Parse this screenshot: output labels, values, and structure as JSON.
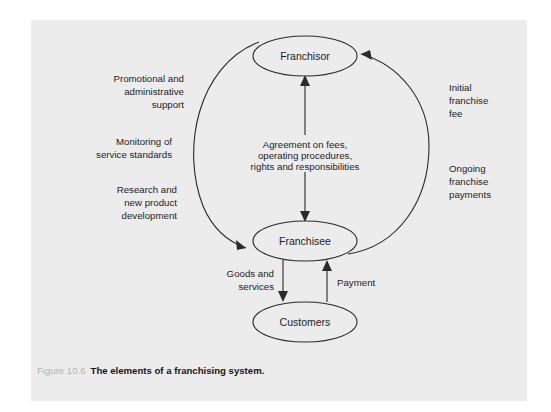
{
  "figure": {
    "caption_number": "Figure 10.6",
    "caption_title": "The elements of a franchising system.",
    "background_color": "#ececec",
    "page_color": "#ffffff",
    "line_color": "#2b2b2b",
    "text_color": "#1c1c1c",
    "caption_number_color": "#b3b3b3"
  },
  "nodes": [
    {
      "id": "franchisor",
      "label": "Franchisor",
      "cx": 274,
      "cy": 36,
      "rx": 52,
      "ry": 20
    },
    {
      "id": "franchisee",
      "label": "Franchisee",
      "cx": 274,
      "cy": 221,
      "rx": 52,
      "ry": 20
    },
    {
      "id": "customers",
      "label": "Customers",
      "cx": 274,
      "cy": 302,
      "rx": 52,
      "ry": 20
    }
  ],
  "center_text": {
    "lines": [
      "Agreement on fees,",
      "operating procedures,",
      "rights and responsibilities"
    ]
  },
  "left_labels": [
    {
      "id": "promotional-support",
      "lines": [
        "Promotional and",
        "administrative",
        "support"
      ]
    },
    {
      "id": "monitoring-standards",
      "lines": [
        "Monitoring of",
        "service standards"
      ]
    },
    {
      "id": "research-development",
      "lines": [
        "Research and",
        "new product",
        "development"
      ]
    }
  ],
  "right_labels": [
    {
      "id": "initial-franchise-fee",
      "lines": [
        "Initial",
        "franchise",
        "fee"
      ]
    },
    {
      "id": "ongoing-franchise-payments",
      "lines": [
        "Ongoing",
        "franchise",
        "payments"
      ]
    }
  ],
  "bottom_labels": [
    {
      "id": "goods-and-services",
      "lines": [
        "Goods and",
        "services"
      ]
    },
    {
      "id": "payment",
      "lines": [
        "Payment"
      ]
    }
  ],
  "flows": [
    {
      "id": "franchisor-to-franchisee-arc",
      "from": "franchisor",
      "to": "franchisee",
      "direction": "down-left"
    },
    {
      "id": "franchisee-to-franchisor-arc",
      "from": "franchisee",
      "to": "franchisor",
      "direction": "up-right"
    },
    {
      "id": "agreement-up",
      "from": "agreement",
      "to": "franchisor",
      "direction": "up"
    },
    {
      "id": "agreement-down",
      "from": "agreement",
      "to": "franchisee",
      "direction": "down"
    },
    {
      "id": "goods-services-down",
      "from": "franchisee",
      "to": "customers",
      "direction": "down"
    },
    {
      "id": "payment-up",
      "from": "customers",
      "to": "franchisee",
      "direction": "up"
    }
  ]
}
